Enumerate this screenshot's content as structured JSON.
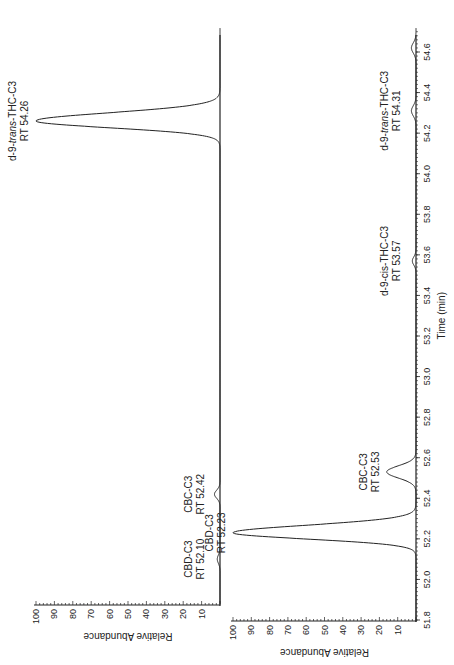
{
  "chart_data": [
    {
      "type": "line",
      "panel": "top",
      "orientation": "rotated-90-ccw",
      "title": "",
      "xlabel": "",
      "ylabel": "Relative Abundance",
      "xlim": [
        51.8,
        54.7
      ],
      "ylim": [
        0,
        100
      ],
      "yticks": [
        10,
        20,
        30,
        40,
        50,
        60,
        70,
        80,
        90,
        100
      ],
      "grid": false,
      "peaks": [
        {
          "compound": "CBD-C3",
          "rt": 52.1,
          "height": 1.5,
          "width": 0.02
        },
        {
          "compound": "CBC-C3",
          "rt": 52.42,
          "height": 3,
          "width": 0.02
        },
        {
          "compound": "d-9-trans-THC-C3",
          "rt": 54.26,
          "height": 100,
          "width": 0.035
        }
      ],
      "annotations": [
        {
          "line1": "CBD-C3",
          "line2": "RT 52.10",
          "rt": 52.1
        },
        {
          "line1": "CBC-C3",
          "line2": "RT 52.42",
          "rt": 52.42
        },
        {
          "line1": "d-9-",
          "italic": "trans",
          "line1_suffix": "-THC-C3",
          "line2": "RT 54.26",
          "rt": 54.26
        }
      ]
    },
    {
      "type": "line",
      "panel": "bottom",
      "orientation": "rotated-90-ccw",
      "title": "",
      "xlabel": "Time (min)",
      "ylabel": "Relative Abundance",
      "xlim": [
        51.8,
        54.7
      ],
      "xticks": [
        51.8,
        52.0,
        52.2,
        52.4,
        52.6,
        52.8,
        53.0,
        53.2,
        53.4,
        53.6,
        53.8,
        54.0,
        54.2,
        54.4,
        54.6
      ],
      "ylim": [
        0,
        100
      ],
      "yticks": [
        10,
        20,
        30,
        40,
        50,
        60,
        70,
        80,
        90,
        100
      ],
      "grid": false,
      "peaks": [
        {
          "compound": "CBD-C3",
          "rt": 52.23,
          "height": 100,
          "width": 0.032
        },
        {
          "compound": "CBC-C3",
          "rt": 52.53,
          "height": 16,
          "width": 0.03
        },
        {
          "compound": "d-9-cis-THC-C3",
          "rt": 53.57,
          "height": 2,
          "width": 0.02
        },
        {
          "compound": "d-9-trans-THC-C3",
          "rt": 54.31,
          "height": 2.5,
          "width": 0.025
        },
        {
          "compound": "unlabeled",
          "rt": 54.62,
          "height": 2.5,
          "width": 0.025
        }
      ],
      "annotations": [
        {
          "line1": "CBD-C3",
          "line2": "RT 52.23",
          "rt": 52.23
        },
        {
          "line1": "CBC-C3",
          "line2": "RT 52.53",
          "rt": 52.53
        },
        {
          "line1": "d-9-cis-THC-C3",
          "line2": "RT 53.57",
          "rt": 53.57
        },
        {
          "line1": "d-9-",
          "italic": "trans",
          "line1_suffix": "-THC-C3",
          "line2": "RT 54.31",
          "rt": 54.31
        }
      ]
    }
  ]
}
